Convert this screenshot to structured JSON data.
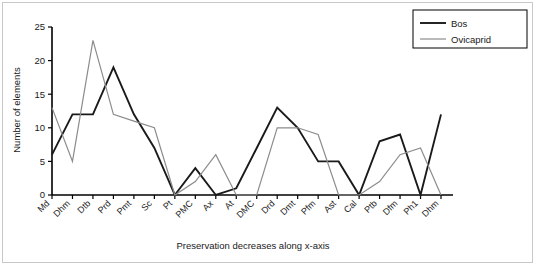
{
  "chart_data": {
    "type": "line",
    "title": "",
    "xlabel": "Preservation decreases along x-axis",
    "ylabel": "Number of elements",
    "ylim": [
      0,
      25
    ],
    "yticks": [
      0,
      5,
      10,
      15,
      20,
      25
    ],
    "grid": false,
    "legend_position": "top-right",
    "categories": [
      "Md",
      "Dhm",
      "Dtb",
      "Prd",
      "Pmt",
      "Sc",
      "Pt",
      "PMC",
      "Ax",
      "At",
      "DMC",
      "Drd",
      "Dmt",
      "Pfm",
      "Ast",
      "Cal",
      "Ptb",
      "Dfm",
      "Ph1",
      "Dhm"
    ],
    "series": [
      {
        "name": "Bos",
        "color": "#1a1a1a",
        "values": [
          6,
          12,
          12,
          19,
          12,
          7,
          0,
          4,
          0,
          1,
          7,
          13,
          10,
          5,
          5,
          0,
          8,
          9,
          0,
          12
        ]
      },
      {
        "name": "Ovicaprid",
        "color": "#8c8c8c",
        "values": [
          13,
          5,
          23,
          12,
          11,
          10,
          0,
          2,
          6,
          0,
          0,
          10,
          10,
          9,
          0,
          0,
          2,
          6,
          7,
          0
        ]
      }
    ]
  },
  "legend": {
    "entries": [
      {
        "label": "Bos"
      },
      {
        "label": "Ovicaprid"
      }
    ]
  },
  "axes": {
    "y_title": "Number of elements",
    "x_title": "Preservation decreases along x-axis",
    "y_tick_labels": [
      "0",
      "5",
      "10",
      "15",
      "20",
      "25"
    ]
  }
}
